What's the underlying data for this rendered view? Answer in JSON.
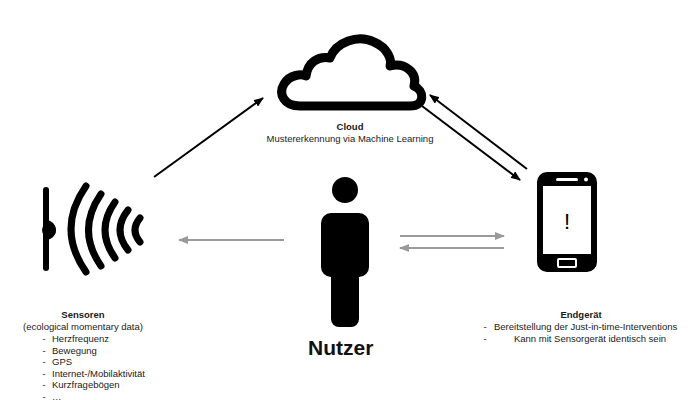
{
  "diagram": {
    "nodes": {
      "cloud": {
        "icon": "cloud-icon",
        "title": "Cloud",
        "subtitle": "Mustererkennung via Machine Learning"
      },
      "sensors": {
        "icon": "sensor-waves-icon",
        "title": "Sensoren",
        "subtitle": "(ecological momentary data)",
        "items": [
          "Herzfrequenz",
          "Bewegung",
          "GPS",
          "Internet-/Mobilaktivität",
          "Kurzfragebögen",
          "…"
        ],
        "bullet": "-"
      },
      "user": {
        "icon": "person-icon",
        "title": "Nutzer"
      },
      "device": {
        "icon": "smartphone-icon",
        "screen_glyph": "!",
        "title": "Endgerät",
        "items": [
          "Bereitstellung der Just-in-time-Interventions",
          "Kann mit Sensorgerät identisch sein"
        ],
        "bullet": "-"
      }
    },
    "edges": [
      {
        "from": "sensors",
        "to": "cloud",
        "style": "black"
      },
      {
        "from": "cloud",
        "to": "device",
        "style": "black"
      },
      {
        "from": "device",
        "to": "cloud",
        "style": "black"
      },
      {
        "from": "user",
        "to": "sensors",
        "style": "gray"
      },
      {
        "from": "user",
        "to": "device",
        "style": "gray"
      },
      {
        "from": "device",
        "to": "user",
        "style": "gray"
      }
    ],
    "colors": {
      "primary": "#000000",
      "arrow_gray": "#9a9a9a",
      "background": "#ffffff"
    }
  }
}
